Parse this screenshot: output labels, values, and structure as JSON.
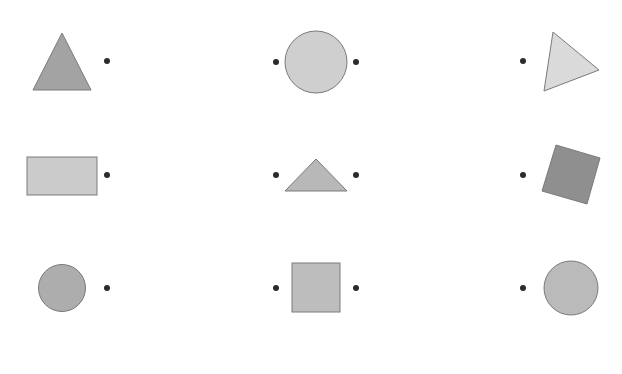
{
  "canvas": {
    "width": 622,
    "height": 374,
    "background": "#ffffff"
  },
  "colors": {
    "dot": "#2b2b2b",
    "stroke": "#7a7a7a",
    "dark_gray": "#9a9a9a",
    "medium_gray": "#b5b5b5",
    "light_gray": "#cccccc",
    "lighter_gray": "#d6d6d6",
    "darkest_gray": "#8c8c8c"
  },
  "grid": {
    "rows": [
      {
        "cells": [
          {
            "shape": "triangle",
            "points": "62,33 33,90 91,90",
            "fill": "#a3a3a3",
            "dots": [
              [
                107,
                61
              ]
            ]
          },
          {
            "shape": "circle",
            "cx": 316,
            "cy": 62,
            "r": 31,
            "fill": "#cfcfcf",
            "dots": [
              [
                276,
                62
              ],
              [
                356,
                62
              ]
            ]
          },
          {
            "shape": "triangle",
            "points": "553,32 599,70 544,91",
            "fill": "#dadada",
            "dots": [
              [
                523,
                61
              ]
            ]
          }
        ]
      },
      {
        "cells": [
          {
            "shape": "rect",
            "x": 27,
            "y": 157,
            "w": 70,
            "h": 38,
            "fill": "#cbcbcb",
            "dots": [
              [
                107,
                175
              ]
            ]
          },
          {
            "shape": "triangle",
            "points": "316,159 285,191 347,191",
            "fill": "#b8b8b8",
            "dots": [
              [
                276,
                175
              ],
              [
                356,
                175
              ]
            ]
          },
          {
            "shape": "polygon",
            "points": "556,145 600,158 587,204 542,191",
            "fill": "#8f8f8f",
            "dots": [
              [
                523,
                175
              ]
            ]
          }
        ]
      },
      {
        "cells": [
          {
            "shape": "circle",
            "cx": 62,
            "cy": 288,
            "r": 23.5,
            "fill": "#adadad",
            "dots": [
              [
                107,
                288
              ]
            ]
          },
          {
            "shape": "rect",
            "x": 292,
            "y": 263,
            "w": 48,
            "h": 49,
            "fill": "#bdbdbd",
            "dots": [
              [
                276,
                288
              ],
              [
                356,
                288
              ]
            ]
          },
          {
            "shape": "circle",
            "cx": 571,
            "cy": 288,
            "r": 27,
            "fill": "#bababa",
            "dots": [
              [
                523,
                288
              ]
            ]
          }
        ]
      }
    ]
  }
}
